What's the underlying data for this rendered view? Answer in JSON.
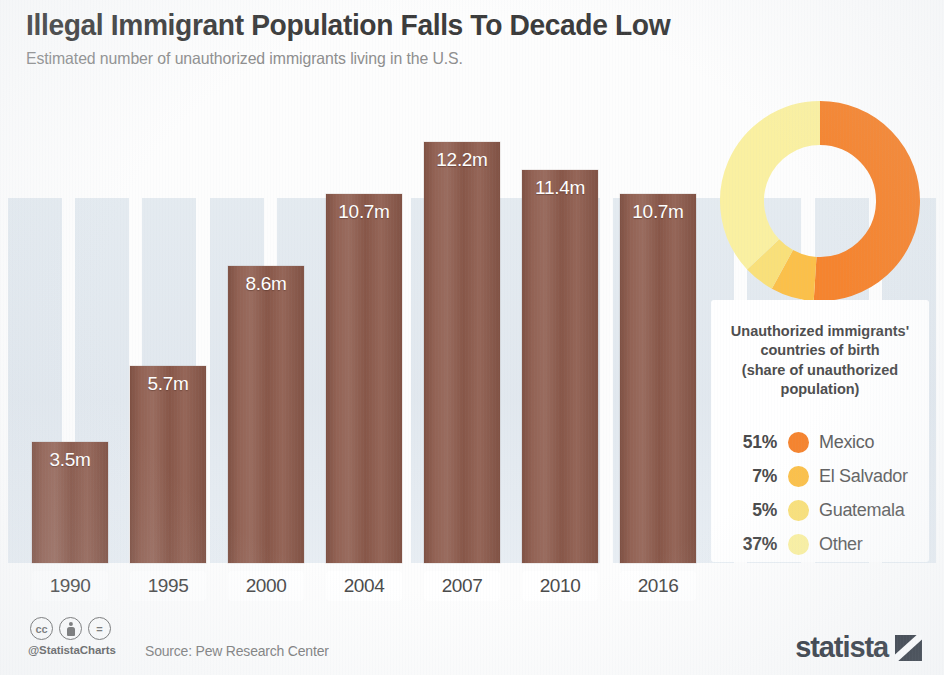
{
  "header": {
    "title": "Illegal Immigrant Population Falls To Decade Low",
    "subtitle": "Estimated number of unauthorized immigrants living in the U.S."
  },
  "footer": {
    "handle": "@StatistaCharts",
    "source": "Source: Pew Research Center",
    "brand": "statista",
    "cc_license": "cc",
    "cc_by": "by",
    "cc_nd": "="
  },
  "legend": {
    "heading": "Unauthorized immigrants' countries of birth (share of unauthorized population)",
    "heading_lines": [
      "Unauthorized immigrants'",
      "countries of birth",
      "(share of unauthorized",
      "population)"
    ]
  },
  "colors": {
    "bar": "#8d5a4b",
    "mexico": "#f5842f",
    "el_salvador": "#fbc04a",
    "guatemala": "#f9e07a",
    "other": "#faf0a1",
    "title": "#3b3b3b",
    "subtitle": "#8e8e8e",
    "stripe": "#e2e9ef"
  },
  "chart_data": [
    {
      "type": "bar",
      "title": "Illegal Immigrant Population Falls To Decade Low",
      "subtitle": "Estimated number of unauthorized immigrants living in the U.S.",
      "xlabel": "",
      "ylabel": "",
      "unit": "m",
      "ylim": [
        0,
        12.2
      ],
      "grid": false,
      "legend": "none",
      "categories": [
        "1990",
        "1995",
        "2000",
        "2004",
        "2007",
        "2010",
        "2016"
      ],
      "values": [
        3.5,
        5.7,
        8.6,
        10.7,
        12.2,
        11.4,
        10.7
      ],
      "value_labels": [
        "3.5m",
        "5.7m",
        "8.6m",
        "10.7m",
        "12.2m",
        "11.4m",
        "10.7m"
      ]
    },
    {
      "type": "pie",
      "title": "Unauthorized immigrants' countries of birth (share of unauthorized population)",
      "donut": true,
      "legend": "below",
      "labels": [
        "Mexico",
        "El Salvador",
        "Guatemala",
        "Other"
      ],
      "values": [
        51,
        7,
        5,
        37
      ],
      "value_labels": [
        "51%",
        "7%",
        "5%",
        "37%"
      ],
      "colors": [
        "#f5842f",
        "#fbc04a",
        "#f9e07a",
        "#faf0a1"
      ]
    }
  ]
}
